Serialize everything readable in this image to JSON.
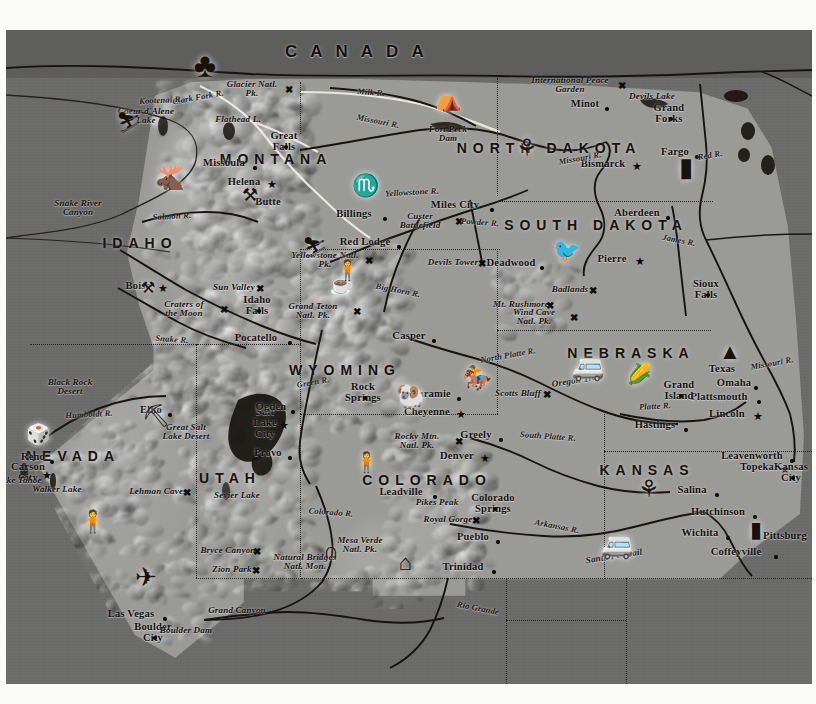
{
  "map": {
    "title_country": "CANADA",
    "background_color": "#6d6d6c",
    "relief_color": "#9a9a97",
    "ink_color": "#14110e"
  },
  "states": [
    {
      "name": "MONTANA",
      "x": 276,
      "y": 159
    },
    {
      "name": "IDAHO",
      "x": 140,
      "y": 243
    },
    {
      "name": "WYOMING",
      "x": 345,
      "y": 370
    },
    {
      "name": "NEVADA",
      "x": 73,
      "y": 456
    },
    {
      "name": "UTAH",
      "x": 230,
      "y": 478
    },
    {
      "name": "COLORADO",
      "x": 427,
      "y": 480
    },
    {
      "name": "NORTH DAKOTA",
      "x": 549,
      "y": 148
    },
    {
      "name": "SOUTH DAKOTA",
      "x": 596,
      "y": 225
    },
    {
      "name": "NEBRASKA",
      "x": 631,
      "y": 353
    },
    {
      "name": "KANSAS",
      "x": 647,
      "y": 470
    }
  ],
  "cities": [
    {
      "name": "Missoula",
      "x": 224,
      "y": 162,
      "marker": "dot"
    },
    {
      "name": "Helena",
      "x": 244,
      "y": 181,
      "marker": "star"
    },
    {
      "name": "Butte",
      "x": 268,
      "y": 201,
      "marker": "icon"
    },
    {
      "name": "Great Falls",
      "x": 284,
      "y": 141,
      "marker": "dot"
    },
    {
      "name": "Billings",
      "x": 354,
      "y": 213,
      "marker": "dot"
    },
    {
      "name": "Miles City",
      "x": 455,
      "y": 204,
      "marker": "dot"
    },
    {
      "name": "Red Lodge",
      "x": 365,
      "y": 241,
      "marker": "dot"
    },
    {
      "name": "Boise",
      "x": 138,
      "y": 285,
      "marker": "star"
    },
    {
      "name": "Idaho Falls",
      "x": 257,
      "y": 305,
      "marker": "dot"
    },
    {
      "name": "Pocatello",
      "x": 256,
      "y": 337,
      "marker": "dot"
    },
    {
      "name": "Casper",
      "x": 409,
      "y": 335,
      "marker": "dot"
    },
    {
      "name": "Rock Springs",
      "x": 363,
      "y": 392,
      "marker": "dot"
    },
    {
      "name": "Laramie",
      "x": 431,
      "y": 393,
      "marker": "dot"
    },
    {
      "name": "Cheyenne",
      "x": 427,
      "y": 411,
      "marker": "star"
    },
    {
      "name": "Greely",
      "x": 476,
      "y": 434,
      "marker": "dot"
    },
    {
      "name": "Denver",
      "x": 457,
      "y": 455,
      "marker": "star"
    },
    {
      "name": "Leadville",
      "x": 401,
      "y": 491,
      "marker": "dot"
    },
    {
      "name": "Colorado Springs",
      "x": 493,
      "y": 503,
      "marker": "dot"
    },
    {
      "name": "Pueblo",
      "x": 473,
      "y": 536,
      "marker": "dot"
    },
    {
      "name": "Trinidad",
      "x": 463,
      "y": 566,
      "marker": "dot"
    },
    {
      "name": "Salt Lake City",
      "x": 265,
      "y": 422,
      "marker": "star"
    },
    {
      "name": "Ogden",
      "x": 271,
      "y": 406,
      "marker": "dot"
    },
    {
      "name": "Provo",
      "x": 268,
      "y": 452,
      "marker": "dot"
    },
    {
      "name": "Elko",
      "x": 151,
      "y": 409,
      "marker": "dot"
    },
    {
      "name": "Reno",
      "x": 33,
      "y": 456,
      "marker": "dot"
    },
    {
      "name": "Carson City",
      "x": 28,
      "y": 472,
      "marker": "star"
    },
    {
      "name": "Las Vegas",
      "x": 131,
      "y": 613,
      "marker": "dot"
    },
    {
      "name": "Boulder City",
      "x": 153,
      "y": 632,
      "marker": "dot"
    },
    {
      "name": "Minot",
      "x": 585,
      "y": 103,
      "marker": "dot"
    },
    {
      "name": "Grand Forks",
      "x": 669,
      "y": 113,
      "marker": "dot"
    },
    {
      "name": "Bismarck",
      "x": 603,
      "y": 163,
      "marker": "star"
    },
    {
      "name": "Fargo",
      "x": 675,
      "y": 151,
      "marker": "dot"
    },
    {
      "name": "Aberdeen",
      "x": 637,
      "y": 212,
      "marker": "dot"
    },
    {
      "name": "Pierre",
      "x": 612,
      "y": 258,
      "marker": "star"
    },
    {
      "name": "Deadwood",
      "x": 511,
      "y": 262,
      "marker": "dot"
    },
    {
      "name": "Sioux Falls",
      "x": 706,
      "y": 289,
      "marker": "dot"
    },
    {
      "name": "Omaha",
      "x": 734,
      "y": 382,
      "marker": "dot"
    },
    {
      "name": "Plattsmouth",
      "x": 719,
      "y": 396,
      "marker": "dot"
    },
    {
      "name": "Lincoln",
      "x": 727,
      "y": 413,
      "marker": "star"
    },
    {
      "name": "Grand Island",
      "x": 679,
      "y": 390,
      "marker": "dot"
    },
    {
      "name": "Hastings",
      "x": 655,
      "y": 424,
      "marker": "dot"
    },
    {
      "name": "Topeka",
      "x": 757,
      "y": 466,
      "marker": "star"
    },
    {
      "name": "Leavenworth",
      "x": 752,
      "y": 455,
      "marker": "dot"
    },
    {
      "name": "Kansas City",
      "x": 791,
      "y": 472,
      "marker": "dot"
    },
    {
      "name": "Salina",
      "x": 692,
      "y": 489,
      "marker": "dot"
    },
    {
      "name": "Hutchinson",
      "x": 718,
      "y": 511,
      "marker": "dot"
    },
    {
      "name": "Wichita",
      "x": 700,
      "y": 532,
      "marker": "dot"
    },
    {
      "name": "Coffeyville",
      "x": 736,
      "y": 551,
      "marker": "dot"
    },
    {
      "name": "Pittsburg",
      "x": 785,
      "y": 535,
      "marker": "dot"
    },
    {
      "name": "Texas",
      "x": 722,
      "y": 368,
      "marker": "none"
    }
  ],
  "features": [
    {
      "name": "Glacier Natl. Pk.",
      "x": 252,
      "y": 89,
      "marker": "x"
    },
    {
      "name": "Flathead L.",
      "x": 238,
      "y": 120,
      "marker": "none"
    },
    {
      "name": "Coeur d'Alene Lake",
      "x": 146,
      "y": 116,
      "marker": "none"
    },
    {
      "name": "Fort Peck Dam",
      "x": 448,
      "y": 134,
      "marker": "none"
    },
    {
      "name": "Custer Battlefield",
      "x": 420,
      "y": 221,
      "marker": "x"
    },
    {
      "name": "Yellowstone Natl. Pk.",
      "x": 325,
      "y": 260,
      "marker": "x"
    },
    {
      "name": "Grand Teton Natl. Pk.",
      "x": 313,
      "y": 311,
      "marker": "x"
    },
    {
      "name": "Devils Tower",
      "x": 453,
      "y": 263,
      "marker": "x"
    },
    {
      "name": "Badlands",
      "x": 570,
      "y": 290,
      "marker": "x"
    },
    {
      "name": "Mt. Rushmore",
      "x": 521,
      "y": 305,
      "marker": "x"
    },
    {
      "name": "Wind Cave Natl. Pk.",
      "x": 534,
      "y": 317,
      "marker": "x"
    },
    {
      "name": "Scotts Bluff",
      "x": 518,
      "y": 394,
      "marker": "x"
    },
    {
      "name": "Sun Valley",
      "x": 234,
      "y": 288,
      "marker": "x"
    },
    {
      "name": "Craters of the Moon",
      "x": 184,
      "y": 309,
      "marker": "x"
    },
    {
      "name": "Snake River Canyon",
      "x": 78,
      "y": 208,
      "marker": "none"
    },
    {
      "name": "Black Rock Desert",
      "x": 70,
      "y": 387,
      "marker": "none"
    },
    {
      "name": "Great Salt Lake Desert",
      "x": 186,
      "y": 432,
      "marker": "none"
    },
    {
      "name": "Lehman Caves",
      "x": 158,
      "y": 492,
      "marker": "x"
    },
    {
      "name": "Walker Lake",
      "x": 57,
      "y": 490,
      "marker": "none"
    },
    {
      "name": "Lake Tahoe",
      "x": 19,
      "y": 481,
      "marker": "none"
    },
    {
      "name": "Sevier Lake",
      "x": 237,
      "y": 496,
      "marker": "none"
    },
    {
      "name": "Bryce Canyon",
      "x": 228,
      "y": 551,
      "marker": "x"
    },
    {
      "name": "Zion Park",
      "x": 232,
      "y": 570,
      "marker": "x"
    },
    {
      "name": "Natural Bridges Natl. Mon.",
      "x": 305,
      "y": 562,
      "marker": "none"
    },
    {
      "name": "Mesa Verde Natl. Pk.",
      "x": 360,
      "y": 545,
      "marker": "none"
    },
    {
      "name": "Rocky Mtn. Natl. Pk.",
      "x": 417,
      "y": 441,
      "marker": "x"
    },
    {
      "name": "Pikes Peak",
      "x": 437,
      "y": 503,
      "marker": "none"
    },
    {
      "name": "Royal Gorge",
      "x": 448,
      "y": 520,
      "marker": "x"
    },
    {
      "name": "International Peace Garden",
      "x": 570,
      "y": 85,
      "marker": "x"
    },
    {
      "name": "Devils Lake",
      "x": 652,
      "y": 97,
      "marker": "none"
    },
    {
      "name": "Grand Canyon",
      "x": 237,
      "y": 611,
      "marker": "none"
    },
    {
      "name": "Boulder Dam",
      "x": 186,
      "y": 631,
      "marker": "none"
    }
  ],
  "rivers": [
    {
      "name": "Clark Fork R.",
      "x": 198,
      "y": 97
    },
    {
      "name": "Kootenai R.",
      "x": 161,
      "y": 100
    },
    {
      "name": "Milk R.",
      "x": 371,
      "y": 92
    },
    {
      "name": "Missouri R.",
      "x": 378,
      "y": 121
    },
    {
      "name": "Missouri R.",
      "x": 580,
      "y": 158
    },
    {
      "name": "Yellowstone R.",
      "x": 412,
      "y": 192
    },
    {
      "name": "Powder R.",
      "x": 480,
      "y": 222
    },
    {
      "name": "James R.",
      "x": 679,
      "y": 240
    },
    {
      "name": "Red R.",
      "x": 710,
      "y": 155
    },
    {
      "name": "Salmon R.",
      "x": 172,
      "y": 216
    },
    {
      "name": "Snake R.",
      "x": 172,
      "y": 339
    },
    {
      "name": "Big Horn R.",
      "x": 398,
      "y": 290
    },
    {
      "name": "Green R.",
      "x": 313,
      "y": 382
    },
    {
      "name": "Humboldt R.",
      "x": 89,
      "y": 414
    },
    {
      "name": "Colorado R.",
      "x": 331,
      "y": 512
    },
    {
      "name": "Rio Grande",
      "x": 478,
      "y": 608
    },
    {
      "name": "North Platte R.",
      "x": 508,
      "y": 355
    },
    {
      "name": "Platte R.",
      "x": 655,
      "y": 406
    },
    {
      "name": "South Platte R.",
      "x": 548,
      "y": 436
    },
    {
      "name": "Arkansas R.",
      "x": 557,
      "y": 526
    },
    {
      "name": "Missouri R.",
      "x": 772,
      "y": 363
    }
  ],
  "trails": [
    {
      "name": "Oregon Trail",
      "x": 577,
      "y": 380
    },
    {
      "name": "Santa Fe Trail",
      "x": 614,
      "y": 556
    }
  ],
  "icons": [
    {
      "name": "pine-tree-icon",
      "glyph": "♣",
      "x": 205,
      "y": 66,
      "size": 34
    },
    {
      "name": "skier-icon",
      "glyph": "⛷",
      "x": 128,
      "y": 122,
      "size": 20
    },
    {
      "name": "moose-icon",
      "glyph": "🫎",
      "x": 170,
      "y": 178,
      "size": 24
    },
    {
      "name": "mining-pick-icon",
      "glyph": "⚒",
      "x": 250,
      "y": 195,
      "size": 18
    },
    {
      "name": "longhorn-icon",
      "glyph": "♏",
      "x": 365,
      "y": 186,
      "size": 22
    },
    {
      "name": "teepee-icon",
      "glyph": "⛺",
      "x": 447,
      "y": 100,
      "size": 22
    },
    {
      "name": "wheat-sheaf-icon",
      "glyph": "⚘",
      "x": 527,
      "y": 148,
      "size": 24
    },
    {
      "name": "grain-elevator-icon",
      "glyph": "▮",
      "x": 686,
      "y": 168,
      "size": 26
    },
    {
      "name": "pheasant-icon",
      "glyph": "🐦",
      "x": 566,
      "y": 251,
      "size": 22
    },
    {
      "name": "skier-icon-2",
      "glyph": "⛷",
      "x": 314,
      "y": 247,
      "size": 20
    },
    {
      "name": "geyser-icon",
      "glyph": "☕",
      "x": 341,
      "y": 285,
      "size": 20
    },
    {
      "name": "bighorn-sheep-icon",
      "glyph": "🐏",
      "x": 411,
      "y": 396,
      "size": 24
    },
    {
      "name": "bronco-rider-icon",
      "glyph": "🏇",
      "x": 477,
      "y": 378,
      "size": 24
    },
    {
      "name": "covered-wagon-icon",
      "glyph": "🚐",
      "x": 588,
      "y": 368,
      "size": 26
    },
    {
      "name": "corn-icon",
      "glyph": "🌽",
      "x": 639,
      "y": 374,
      "size": 20
    },
    {
      "name": "oil-derrick-icon",
      "glyph": "▲",
      "x": 730,
      "y": 352,
      "size": 22
    },
    {
      "name": "grain-icon-kansas",
      "glyph": "⚘",
      "x": 649,
      "y": 489,
      "size": 24
    },
    {
      "name": "smokestack-icon",
      "glyph": "▮",
      "x": 756,
      "y": 530,
      "size": 22
    },
    {
      "name": "covered-wagon-icon-2",
      "glyph": "🚐",
      "x": 617,
      "y": 546,
      "size": 26
    },
    {
      "name": "dice-icon",
      "glyph": "🎲",
      "x": 38,
      "y": 434,
      "size": 20
    },
    {
      "name": "prospector-icon",
      "glyph": "🧍",
      "x": 92,
      "y": 522,
      "size": 22
    },
    {
      "name": "airplane-icon",
      "glyph": "✈",
      "x": 146,
      "y": 578,
      "size": 26
    },
    {
      "name": "mining-head-icon",
      "glyph": "⛏",
      "x": 156,
      "y": 416,
      "size": 22
    },
    {
      "name": "prospector-icon-2",
      "glyph": "🧍",
      "x": 366,
      "y": 462,
      "size": 20
    },
    {
      "name": "pueblo-icon",
      "glyph": "⌂",
      "x": 405,
      "y": 563,
      "size": 22
    },
    {
      "name": "arch-icon",
      "glyph": "∩",
      "x": 331,
      "y": 551,
      "size": 22
    },
    {
      "name": "prospector-icon-3",
      "glyph": "🧍",
      "x": 347,
      "y": 270,
      "size": 20
    },
    {
      "name": "mining-icon-butte",
      "glyph": "⚒",
      "x": 148,
      "y": 288,
      "size": 16
    }
  ]
}
